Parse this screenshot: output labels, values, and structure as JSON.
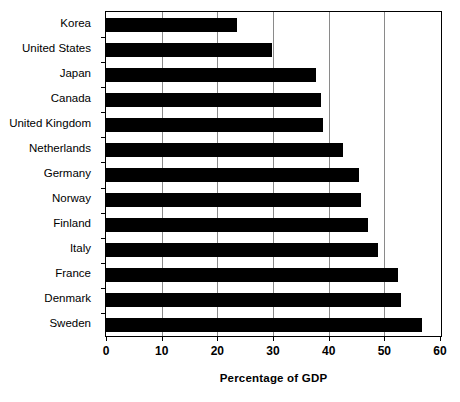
{
  "chart_data": {
    "type": "bar",
    "orientation": "horizontal",
    "title": "",
    "xlabel": "Percentage of GDP",
    "ylabel": "",
    "xlim": [
      0,
      60
    ],
    "xticks": [
      0,
      10,
      20,
      30,
      40,
      50,
      60
    ],
    "xticklabels": [
      "0",
      "10",
      "20",
      "30",
      "40",
      "50",
      "60"
    ],
    "grid": true,
    "grid_axis": "x",
    "legend": null,
    "bar_color": "#000000",
    "background_color": "#ffffff",
    "categories": [
      "Korea",
      "United States",
      "Japan",
      "Canada",
      "United Kingdom",
      "Netherlands",
      "Germany",
      "Norway",
      "Finland",
      "Italy",
      "France",
      "Denmark",
      "Sweden"
    ],
    "values": [
      23.5,
      29.8,
      37.8,
      38.6,
      39.0,
      42.5,
      45.5,
      45.8,
      47.0,
      48.9,
      52.5,
      53.0,
      56.8
    ]
  }
}
